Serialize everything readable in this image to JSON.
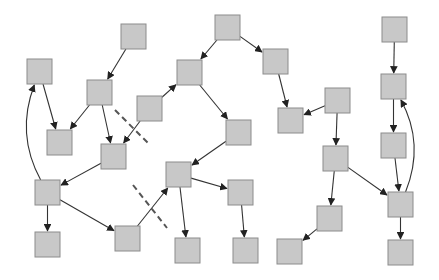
{
  "diagram": {
    "type": "directed-graph",
    "canvas": {
      "width": 439,
      "height": 280,
      "background": "#ffffff"
    },
    "style": {
      "node_fill": "#c8c8c8",
      "node_stroke": "#8c8c8c",
      "edge_color": "#333333",
      "cut_color": "#555555",
      "node_size": 25
    },
    "nodes": [
      {
        "id": "n1",
        "x": 121,
        "y": 24
      },
      {
        "id": "n2",
        "x": 27,
        "y": 59
      },
      {
        "id": "n3",
        "x": 87,
        "y": 80
      },
      {
        "id": "n4",
        "x": 47,
        "y": 130
      },
      {
        "id": "n5",
        "x": 101,
        "y": 144
      },
      {
        "id": "n6",
        "x": 137,
        "y": 96
      },
      {
        "id": "n7",
        "x": 177,
        "y": 60
      },
      {
        "id": "n8",
        "x": 35,
        "y": 180
      },
      {
        "id": "n9",
        "x": 35,
        "y": 232
      },
      {
        "id": "n10",
        "x": 115,
        "y": 226
      },
      {
        "id": "n11",
        "x": 166,
        "y": 162
      },
      {
        "id": "n12",
        "x": 175,
        "y": 238
      },
      {
        "id": "n13",
        "x": 226,
        "y": 120
      },
      {
        "id": "n14",
        "x": 228,
        "y": 180
      },
      {
        "id": "n15",
        "x": 233,
        "y": 238
      },
      {
        "id": "n16",
        "x": 215,
        "y": 15
      },
      {
        "id": "n17",
        "x": 263,
        "y": 49
      },
      {
        "id": "n18",
        "x": 278,
        "y": 108
      },
      {
        "id": "n19",
        "x": 325,
        "y": 88
      },
      {
        "id": "n20",
        "x": 323,
        "y": 146
      },
      {
        "id": "n21",
        "x": 317,
        "y": 206
      },
      {
        "id": "n22",
        "x": 277,
        "y": 239
      },
      {
        "id": "n23",
        "x": 382,
        "y": 17
      },
      {
        "id": "n24",
        "x": 381,
        "y": 74
      },
      {
        "id": "n25",
        "x": 381,
        "y": 133
      },
      {
        "id": "n26",
        "x": 388,
        "y": 192
      },
      {
        "id": "n27",
        "x": 388,
        "y": 240
      }
    ],
    "edges": [
      {
        "from": "n1",
        "to": "n3"
      },
      {
        "from": "n2",
        "to": "n4"
      },
      {
        "from": "n3",
        "to": "n4"
      },
      {
        "from": "n3",
        "to": "n5"
      },
      {
        "from": "n6",
        "to": "n5"
      },
      {
        "from": "n6",
        "to": "n7"
      },
      {
        "from": "n5",
        "to": "n8"
      },
      {
        "from": "n8",
        "to": "n2",
        "curved": true
      },
      {
        "from": "n8",
        "to": "n9"
      },
      {
        "from": "n8",
        "to": "n10"
      },
      {
        "from": "n10",
        "to": "n11"
      },
      {
        "from": "n11",
        "to": "n12"
      },
      {
        "from": "n11",
        "to": "n14"
      },
      {
        "from": "n7",
        "to": "n13"
      },
      {
        "from": "n13",
        "to": "n11"
      },
      {
        "from": "n14",
        "to": "n15"
      },
      {
        "from": "n16",
        "to": "n7"
      },
      {
        "from": "n16",
        "to": "n17"
      },
      {
        "from": "n17",
        "to": "n18"
      },
      {
        "from": "n19",
        "to": "n18"
      },
      {
        "from": "n19",
        "to": "n20"
      },
      {
        "from": "n20",
        "to": "n21"
      },
      {
        "from": "n20",
        "to": "n26"
      },
      {
        "from": "n21",
        "to": "n22"
      },
      {
        "from": "n23",
        "to": "n24"
      },
      {
        "from": "n24",
        "to": "n25"
      },
      {
        "from": "n25",
        "to": "n26"
      },
      {
        "from": "n26",
        "to": "n24",
        "curved": true
      },
      {
        "from": "n26",
        "to": "n27"
      }
    ],
    "cut_lines": [
      {
        "x1": 115,
        "y1": 110,
        "x2": 150,
        "y2": 145
      },
      {
        "x1": 133,
        "y1": 185,
        "x2": 167,
        "y2": 228
      }
    ]
  }
}
